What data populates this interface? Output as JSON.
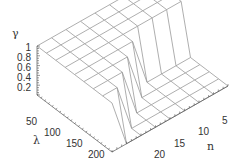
{
  "chart_data": {
    "type": "surface-wireframe",
    "title": "",
    "xlabel": "λ",
    "ylabel": "n",
    "zlabel": "γ",
    "x_ticks": [
      50,
      100,
      150,
      200
    ],
    "y_ticks": [
      5,
      10,
      15,
      20
    ],
    "z_ticks": [
      0.2,
      0.4,
      0.6,
      0.8,
      1
    ],
    "xlim": [
      25,
      225
    ],
    "ylim": [
      1,
      25
    ],
    "zlim": [
      0.1,
      1
    ],
    "grid": false,
    "x": [
      25,
      50,
      75,
      100,
      125,
      150,
      175,
      200,
      225
    ],
    "y": [
      1,
      4,
      7,
      10,
      13,
      16,
      19,
      22,
      25
    ],
    "z": [
      [
        1,
        1,
        1,
        1,
        1,
        1,
        1,
        1,
        1
      ],
      [
        1,
        1,
        1,
        1,
        1,
        1,
        1,
        1,
        1
      ],
      [
        1,
        1,
        1,
        1,
        1,
        1,
        1,
        1,
        1
      ],
      [
        1,
        1,
        1,
        1,
        1,
        1,
        1,
        1,
        1
      ],
      [
        1,
        1,
        1,
        1,
        1,
        0.1,
        0.1,
        0.1,
        0.1
      ],
      [
        1,
        1,
        1,
        1,
        0.1,
        0.1,
        0.1,
        0.1,
        0.1
      ],
      [
        1,
        1,
        1,
        0.1,
        0.1,
        0.1,
        0.1,
        0.1,
        0.1
      ],
      [
        1,
        1,
        0.1,
        0.1,
        0.1,
        0.1,
        0.1,
        0.1,
        0.1
      ],
      [
        1,
        0.1,
        0.1,
        0.1,
        0.1,
        0.1,
        0.1,
        0.1,
        0.1
      ]
    ],
    "line_color": "#999999",
    "axis_color": "#555555"
  },
  "labels": {
    "z_title": "γ",
    "x_title": "λ",
    "y_title": "n",
    "z_ticks": [
      "0.2",
      "0.4",
      "0.6",
      "0.8",
      "1"
    ],
    "x_ticks": [
      "50",
      "100",
      "150",
      "200"
    ],
    "y_ticks": [
      "5",
      "10",
      "15",
      "20"
    ]
  }
}
